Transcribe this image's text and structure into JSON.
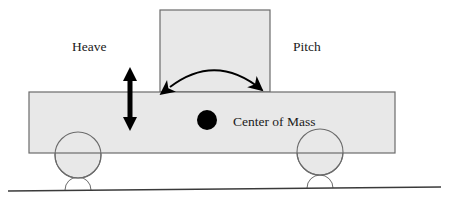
{
  "diagram": {
    "labels": {
      "heave": "Heave",
      "pitch": "Pitch",
      "center_of_mass": "Center of Mass"
    },
    "colors": {
      "body_fill": "#e8e8e8",
      "body_stroke": "#6b6b6b",
      "wheel_fill": "#e8e8e8",
      "wheel_stroke": "#6b6b6b",
      "ground_stroke": "#3a3a3a",
      "com_fill": "#000000",
      "arrow_fill": "#000000",
      "text_fill": "#1a1a1a",
      "background": "#ffffff"
    },
    "shapes": {
      "chassis": {
        "x": 29,
        "y": 92,
        "width": 366,
        "height": 61
      },
      "cab": {
        "x": 160,
        "y": 10,
        "width": 110,
        "height": 82
      },
      "wheel_front": {
        "cx": 78,
        "cy": 155,
        "r": 23
      },
      "wheel_rear": {
        "cx": 320,
        "cy": 152,
        "r": 23
      },
      "contact_patch_front": {
        "cx": 78,
        "cy": 190,
        "r": 13
      },
      "contact_patch_rear": {
        "cx": 320,
        "cy": 188,
        "r": 13
      },
      "center_of_mass_dot": {
        "cx": 207,
        "cy": 120,
        "r": 10
      },
      "ground_line": {
        "x1": 8,
        "y1": 191,
        "x2": 441,
        "y2": 187
      },
      "heave_arrow": {
        "x": 130,
        "y_top": 68,
        "y_bottom": 130,
        "shaft_width": 5,
        "head_width": 13,
        "head_height": 13
      },
      "pitch_arc": {
        "x_left": 168,
        "y_left": 89,
        "x_right": 264,
        "y_right": 92,
        "apex_y": 62
      }
    },
    "label_positions": {
      "heave": {
        "x": 72,
        "y": 51
      },
      "pitch": {
        "x": 293,
        "y": 51
      },
      "center_of_mass": {
        "x": 233,
        "y": 126
      }
    }
  }
}
